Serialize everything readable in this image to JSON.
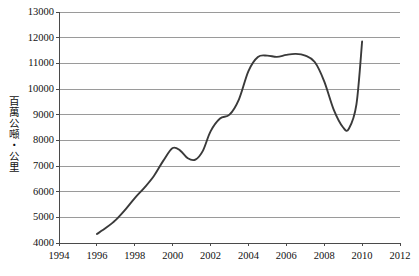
{
  "chart_data": {
    "type": "line",
    "title": "",
    "xlabel": "",
    "ylabel": "百萬公噸‧公里",
    "xlim": [
      1994,
      2012
    ],
    "ylim": [
      4000,
      13000
    ],
    "grid": true,
    "legend": "none",
    "xticks": [
      1994,
      1996,
      1998,
      2000,
      2002,
      2004,
      2006,
      2008,
      2010,
      2012
    ],
    "yticks": [
      4000,
      5000,
      6000,
      7000,
      8000,
      9000,
      10000,
      11000,
      12000,
      13000
    ],
    "series": [
      {
        "name": "貨運周轉量",
        "color": "#3a3a3a",
        "x": [
          1996,
          1996.5,
          1997,
          1997.5,
          1998,
          1998.5,
          1999,
          1999.5,
          2000,
          2000.4,
          2000.8,
          2001.2,
          2001.6,
          2002,
          2002.5,
          2003,
          2003.5,
          2004,
          2004.5,
          2005,
          2005.5,
          2006,
          2006.5,
          2007,
          2007.5,
          2008,
          2008.5,
          2009,
          2009.3,
          2009.7,
          2010
        ],
        "y": [
          4350,
          4600,
          4900,
          5300,
          5750,
          6150,
          6600,
          7200,
          7700,
          7600,
          7300,
          7250,
          7600,
          8350,
          8850,
          9000,
          9600,
          10700,
          11250,
          11300,
          11250,
          11330,
          11370,
          11300,
          11050,
          10300,
          9200,
          8500,
          8450,
          9400,
          11850
        ]
      }
    ]
  },
  "axis": {
    "y_title": "百萬公噸‧公里",
    "y_labels": [
      "13000",
      "12000",
      "11000",
      "10000",
      "9000",
      "8000",
      "7000",
      "6000",
      "5000",
      "4000"
    ],
    "x_labels": [
      "1994",
      "1996",
      "1998",
      "2000",
      "2002",
      "2004",
      "2006",
      "2008",
      "2010",
      "2012"
    ]
  },
  "style": {
    "line_color": "#3a3a3a",
    "grid_color": "#9a9a9a",
    "axis_color": "#4a4a4a",
    "background": "#ffffff"
  }
}
